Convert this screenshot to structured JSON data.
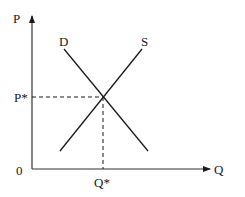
{
  "diagram": {
    "title": "",
    "axes": {
      "y_label": "P",
      "x_label": "Q",
      "origin_label": "0"
    },
    "curves": [
      {
        "name": "demand",
        "label": "D"
      },
      {
        "name": "supply",
        "label": "S"
      }
    ],
    "equilibrium": {
      "price_label": "P*",
      "quantity_label": "Q*"
    },
    "colors": {
      "line": "#1a1a1a",
      "axis": "#333333",
      "background": "#ffffff"
    }
  }
}
